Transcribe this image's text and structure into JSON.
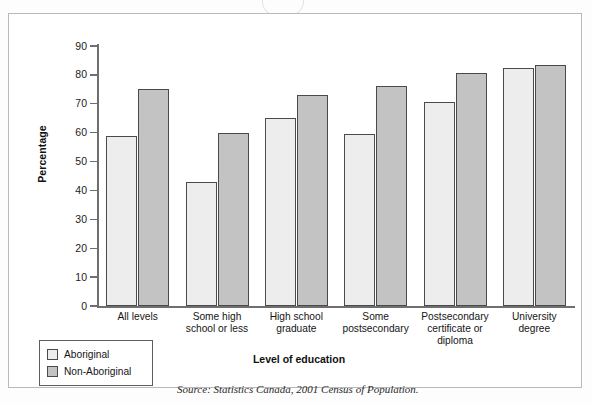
{
  "figure": {
    "source_note": "Source: Statistics Canada, 2001 Census of Population."
  },
  "chart_data": {
    "type": "bar",
    "title": "",
    "xlabel": "Level of education",
    "ylabel": "Percentage",
    "ylim": [
      0,
      90
    ],
    "yticks": [
      0,
      10,
      20,
      30,
      40,
      50,
      60,
      70,
      80,
      90
    ],
    "ytick_labels": [
      "0",
      "10",
      "20",
      "30",
      "40",
      "50",
      "60",
      "70",
      "80",
      "90"
    ],
    "grid": false,
    "legend_position": "below-left",
    "categories": [
      "All levels",
      "Some high school or less",
      "High school graduate",
      "Some postsecondary",
      "Postsecondary certificate or diploma",
      "University degree"
    ],
    "category_lines": [
      [
        "All levels"
      ],
      [
        "Some high",
        "school or less"
      ],
      [
        "High school",
        "graduate"
      ],
      [
        "Some",
        "postsecondary"
      ],
      [
        "Postsecondary",
        "certificate or",
        "diploma"
      ],
      [
        "University",
        "degree"
      ]
    ],
    "series": [
      {
        "name": "Aboriginal",
        "color": "#ededed",
        "values": [
          59,
          43,
          65,
          59.5,
          70.5,
          82.5
        ]
      },
      {
        "name": "Non-Aboriginal",
        "color": "#c3c3c3",
        "values": [
          75,
          60,
          73,
          76,
          80.5,
          83.5
        ]
      }
    ]
  }
}
